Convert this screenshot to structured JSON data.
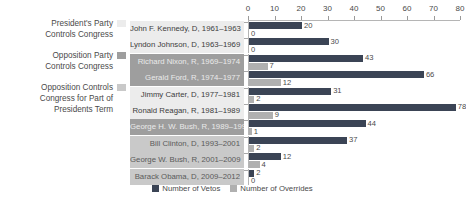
{
  "side_legend": {
    "items": [
      {
        "label": "President's Party\nControls Congress",
        "swatch_name": "swatch-own-party",
        "color": "#ececec"
      },
      {
        "label": "Opposition Party\nControls Congress",
        "swatch_name": "swatch-opposition-party",
        "color": "#9e9e9e"
      },
      {
        "label": "Opposition Controls\nCongress for Part of\nPresidents Term",
        "swatch_name": "swatch-partial-opposition",
        "color": "#c9c9c9"
      }
    ]
  },
  "bottom_legend": {
    "items": [
      {
        "label": "Number of Vetos",
        "color": "#3b4455"
      },
      {
        "label": "Number of Overrides",
        "color": "#b0b0b0"
      }
    ]
  },
  "chart_data": {
    "type": "bar",
    "title": "",
    "xlabel": "",
    "ylabel": "",
    "xlim": [
      0,
      80
    ],
    "grid": false,
    "legend_position": "bottom",
    "orientation": "horizontal",
    "tick_labels": [
      "0",
      "10",
      "20",
      "30",
      "40",
      "50",
      "60",
      "70",
      "80"
    ],
    "ticks": [
      0,
      10,
      20,
      30,
      40,
      50,
      60,
      70,
      80
    ],
    "categories": [
      "John F. Kennedy, D, 1961–1963",
      "Lyndon Johnson, D, 1963–1969",
      "Richard Nixon, R, 1969–1974",
      "Gerald Ford, R, 1974–1977",
      "Jimmy Carter, D, 1977–1981",
      "Ronald Reagan, R, 1981–1989",
      "George H. W. Bush, R, 1989–1993",
      "Bill Clinton, D, 1993–2001",
      "George W. Bush, R, 2001–2009",
      "Barack Obama, D, 2009–2012"
    ],
    "category_congress_control": [
      "own",
      "own",
      "opposition",
      "opposition",
      "own",
      "own",
      "opposition",
      "partial",
      "partial",
      "partial"
    ],
    "series": [
      {
        "name": "Number of Vetos",
        "color": "#3b4455",
        "values": [
          20,
          30,
          43,
          66,
          31,
          78,
          44,
          37,
          12,
          2
        ]
      },
      {
        "name": "Number of Overrides",
        "color": "#b0b0b0",
        "values": [
          0,
          0,
          7,
          12,
          2,
          9,
          1,
          2,
          4,
          0
        ]
      }
    ]
  }
}
